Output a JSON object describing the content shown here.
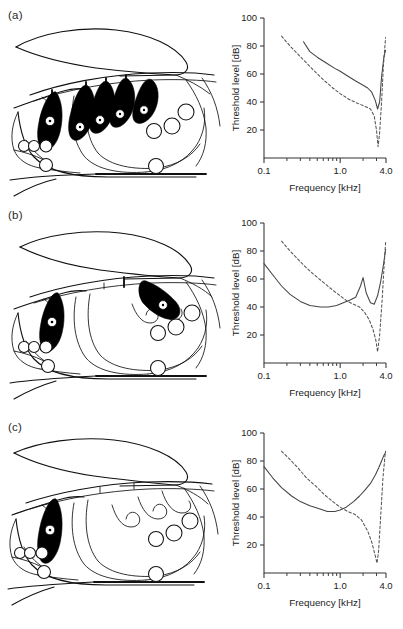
{
  "figure": {
    "panels": [
      {
        "id": "a",
        "label": "(a)",
        "diagram_name": "insect-hearing-organ-cross-section-a",
        "stained_organ_count": 5,
        "chart_data": {
          "type": "line",
          "title": "",
          "xlabel": "Frequency [kHz]",
          "ylabel": "Threshold level [dB]",
          "xscale": "log",
          "xlim": [
            0.1,
            4.0
          ],
          "ylim": [
            0,
            100
          ],
          "xticks": [
            0.1,
            1.0,
            4.0
          ],
          "xticklabels": [
            "0.1",
            "1.0",
            "4.0"
          ],
          "xminorticks": [
            0.2,
            0.3,
            0.4,
            0.5,
            0.6,
            0.7,
            0.8,
            0.9,
            2.0,
            3.0
          ],
          "yticks": [
            20,
            40,
            60,
            80,
            100
          ],
          "yticklabels": [
            "20",
            "40",
            "60",
            "80",
            "100"
          ],
          "grid": false,
          "legend": "none",
          "series": [
            {
              "name": "solid tuning curve",
              "style": "solid",
              "x": [
                0.33,
                0.4,
                0.5,
                0.65,
                0.85,
                1.0,
                1.3,
                1.6,
                2.0,
                2.3,
                2.6,
                2.9,
                3.1,
                3.3,
                3.5,
                3.75,
                3.95
              ],
              "y": [
                83,
                76,
                72,
                68,
                64,
                62,
                58,
                55,
                52,
                50,
                47,
                41,
                35,
                40,
                58,
                72,
                77
              ]
            },
            {
              "name": "dashed tuning curve",
              "style": "dashed",
              "x": [
                0.17,
                0.22,
                0.28,
                0.36,
                0.46,
                0.6,
                0.8,
                1.0,
                1.3,
                1.7,
                2.1,
                2.5,
                2.8,
                3.0,
                3.15,
                3.3,
                3.5,
                3.7,
                3.95
              ],
              "y": [
                87,
                80,
                74,
                68,
                62,
                56,
                50,
                46,
                42,
                39,
                37,
                35,
                30,
                20,
                8,
                18,
                40,
                66,
                86
              ]
            }
          ]
        }
      },
      {
        "id": "b",
        "label": "(b)",
        "diagram_name": "insect-hearing-organ-cross-section-b",
        "stained_organ_count": 2,
        "chart_data": {
          "type": "line",
          "title": "",
          "xlabel": "Frequency [kHz]",
          "ylabel": "Threshold level [dB]",
          "xscale": "log",
          "xlim": [
            0.1,
            4.0
          ],
          "ylim": [
            0,
            100
          ],
          "xticks": [
            0.1,
            1.0,
            4.0
          ],
          "xticklabels": [
            "0.1",
            "1.0",
            "4.0"
          ],
          "xminorticks": [
            0.2,
            0.3,
            0.4,
            0.5,
            0.6,
            0.7,
            0.8,
            0.9,
            2.0,
            3.0
          ],
          "yticks": [
            20,
            40,
            60,
            80,
            100
          ],
          "yticklabels": [
            "20",
            "40",
            "60",
            "80",
            "100"
          ],
          "grid": false,
          "legend": "none",
          "series": [
            {
              "name": "solid tuning curve",
              "style": "solid",
              "x": [
                0.1,
                0.13,
                0.17,
                0.22,
                0.3,
                0.4,
                0.55,
                0.7,
                0.9,
                1.1,
                1.35,
                1.6,
                1.85,
                2.0,
                2.2,
                2.5,
                2.8,
                3.1,
                3.4,
                3.7,
                3.95
              ],
              "y": [
                71,
                63,
                55,
                49,
                44,
                41,
                40,
                40,
                41,
                43,
                45,
                47,
                55,
                61,
                50,
                43,
                42,
                48,
                58,
                70,
                81
              ]
            },
            {
              "name": "dashed tuning curve",
              "style": "dashed",
              "x": [
                0.17,
                0.22,
                0.28,
                0.36,
                0.48,
                0.62,
                0.8,
                1.0,
                1.25,
                1.5,
                1.8,
                2.1,
                2.4,
                2.7,
                2.95,
                3.1,
                3.3,
                3.55,
                3.8,
                3.95
              ],
              "y": [
                87,
                80,
                74,
                68,
                62,
                57,
                52,
                48,
                44,
                42,
                40,
                36,
                31,
                24,
                16,
                8,
                20,
                44,
                72,
                86
              ]
            }
          ]
        }
      },
      {
        "id": "c",
        "label": "(c)",
        "diagram_name": "insect-hearing-organ-cross-section-c",
        "stained_organ_count": 1,
        "chart_data": {
          "type": "line",
          "title": "",
          "xlabel": "Frequency [kHz]",
          "ylabel": "Threshold level [dB]",
          "xscale": "log",
          "xlim": [
            0.1,
            4.0
          ],
          "ylim": [
            0,
            100
          ],
          "xticks": [
            0.1,
            1.0,
            4.0
          ],
          "xticklabels": [
            "0.1",
            "1.0",
            "4.0"
          ],
          "xminorticks": [
            0.2,
            0.3,
            0.4,
            0.5,
            0.6,
            0.7,
            0.8,
            0.9,
            2.0,
            3.0
          ],
          "yticks": [
            20,
            40,
            60,
            80,
            100
          ],
          "yticklabels": [
            "20",
            "40",
            "60",
            "80",
            "100"
          ],
          "grid": false,
          "legend": "none",
          "series": [
            {
              "name": "solid tuning curve",
              "style": "solid",
              "x": [
                0.1,
                0.13,
                0.17,
                0.23,
                0.3,
                0.4,
                0.52,
                0.68,
                0.85,
                1.0,
                1.2,
                1.5,
                1.8,
                2.1,
                2.5,
                2.9,
                3.2,
                3.5,
                3.75,
                3.95
              ],
              "y": [
                76,
                68,
                61,
                55,
                51,
                48,
                46,
                44,
                44,
                45,
                47,
                51,
                55,
                59,
                64,
                70,
                75,
                80,
                84,
                86
              ]
            },
            {
              "name": "dashed tuning curve",
              "style": "dashed",
              "x": [
                0.17,
                0.22,
                0.28,
                0.36,
                0.48,
                0.62,
                0.8,
                1.0,
                1.25,
                1.55,
                1.9,
                2.3,
                2.6,
                2.9,
                3.05,
                3.2,
                3.4,
                3.65,
                3.9,
                3.95
              ],
              "y": [
                87,
                81,
                75,
                68,
                62,
                56,
                51,
                47,
                44,
                42,
                38,
                30,
                22,
                12,
                7,
                16,
                40,
                68,
                85,
                87
              ]
            }
          ]
        }
      }
    ]
  }
}
